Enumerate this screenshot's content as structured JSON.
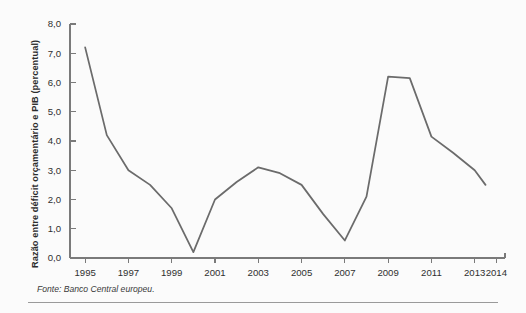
{
  "figure": {
    "source_note": "Fonte: Banco Central europeu."
  },
  "chart_data": {
    "type": "line",
    "title": "",
    "xlabel": "",
    "ylabel": "Razão entre déficit orçamentário e PIB (percentual)",
    "xlim": [
      1994.3,
      2014.4
    ],
    "ylim": [
      0.0,
      8.0
    ],
    "grid": false,
    "legend": null,
    "line_color": "#6b6b6b",
    "background_color": "#fbfbfb",
    "decimal_separator": ",",
    "y_ticks": [
      0,
      1,
      2,
      3,
      4,
      5,
      6,
      7,
      8
    ],
    "y_tick_labels": [
      "0,0",
      "1,0",
      "2,0",
      "3,0",
      "4,0",
      "5,0",
      "6,0",
      "7,0",
      "8,0"
    ],
    "x_ticks": [
      1995,
      1997,
      1999,
      2001,
      2003,
      2005,
      2007,
      2009,
      2011,
      2013,
      2014
    ],
    "x_tick_labels": [
      "1995",
      "1997",
      "1999",
      "2001",
      "2003",
      "2005",
      "2007",
      "2009",
      "2011",
      "2013",
      "2014"
    ],
    "x": [
      1995,
      1996,
      1997,
      1998,
      1999,
      2000,
      2001,
      2002,
      2003,
      2004,
      2005,
      2006,
      2007,
      2008,
      2009,
      2010,
      2011,
      2012,
      2013,
      2013.5
    ],
    "values": [
      7.2,
      4.2,
      3.0,
      2.5,
      1.7,
      0.2,
      2.0,
      2.6,
      3.1,
      2.9,
      2.5,
      1.5,
      0.6,
      2.1,
      6.2,
      6.15,
      4.15,
      3.6,
      3.0,
      2.5
    ],
    "series": [
      {
        "name": "Razão entre déficit orçamentário e PIB",
        "x": [
          1995,
          1996,
          1997,
          1998,
          1999,
          2000,
          2001,
          2002,
          2003,
          2004,
          2005,
          2006,
          2007,
          2008,
          2009,
          2010,
          2011,
          2012,
          2013,
          2013.5
        ],
        "values": [
          7.2,
          4.2,
          3.0,
          2.5,
          1.7,
          0.2,
          2.0,
          2.6,
          3.1,
          2.9,
          2.5,
          1.5,
          0.6,
          2.1,
          6.2,
          6.15,
          4.15,
          3.6,
          3.0,
          2.5
        ]
      }
    ]
  }
}
